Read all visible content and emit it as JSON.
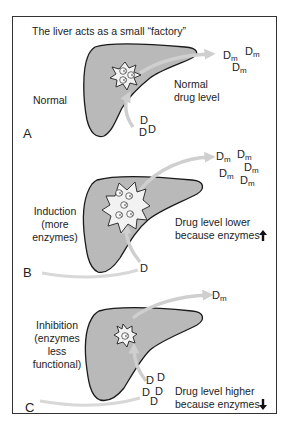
{
  "title": "The liver acts as a small “factory”",
  "colors": {
    "liver_fill": "#b9b9b9",
    "liver_stroke": "#1a1a1a",
    "arrow": "#cfcfcf",
    "star_fill": "#f2f2f2",
    "border": "#333333",
    "text": "#222222"
  },
  "panels": [
    {
      "letter": "A",
      "condition": [
        "Normal"
      ],
      "result": [
        "Normal",
        "drug level"
      ],
      "drug_symbol": "D",
      "drug_count": 3,
      "metabolite_symbol": "D",
      "metabolite_subscript": "m",
      "metabolite_count": 3,
      "enzyme_count": 3
    },
    {
      "letter": "B",
      "condition": [
        "Induction",
        "(more",
        "enzymes)"
      ],
      "result": [
        "Drug level lower",
        "because enzymes"
      ],
      "result_arrow": "up",
      "drug_symbol": "D",
      "drug_count": 1,
      "metabolite_symbol": "D",
      "metabolite_subscript": "m",
      "metabolite_count": 5,
      "enzyme_count": 5
    },
    {
      "letter": "C",
      "condition": [
        "Inhibition",
        "(enzymes",
        "less",
        "functional)"
      ],
      "result": [
        "Drug level higher",
        "because enzymes"
      ],
      "result_arrow": "down",
      "drug_symbol": "D",
      "drug_count": 5,
      "metabolite_symbol": "D",
      "metabolite_subscript": "m",
      "metabolite_count": 1,
      "enzyme_count": 1
    }
  ]
}
